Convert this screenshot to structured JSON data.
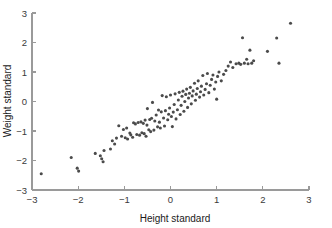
{
  "chart_data": {
    "type": "scatter",
    "title": "",
    "xlabel": "Height standard",
    "ylabel": "Weight standard",
    "xlim": [
      -3,
      3
    ],
    "ylim": [
      -3,
      3
    ],
    "xticks": [
      -3,
      -2,
      -1,
      0,
      1,
      2,
      3
    ],
    "yticks": [
      -3,
      -2,
      -1,
      0,
      1,
      2,
      3
    ],
    "xtick_labels": [
      "−3",
      "−2",
      "−1",
      "0",
      "1",
      "2",
      "3"
    ],
    "ytick_labels": [
      "−3",
      "−2",
      "−1",
      "0",
      "1",
      "2",
      "3"
    ],
    "grid": false,
    "legend": false,
    "marker_color": "#4b4b4b",
    "marker_size": 3.1,
    "axis_color": "#9a9a9a",
    "background_color": "#ffffff",
    "series": [
      {
        "name": "observations",
        "points": [
          [
            -2.8,
            -2.45
          ],
          [
            -2.15,
            -1.9
          ],
          [
            -2.02,
            -2.26
          ],
          [
            -1.99,
            -2.36
          ],
          [
            -1.63,
            -1.76
          ],
          [
            -1.52,
            -1.84
          ],
          [
            -1.49,
            -1.94
          ],
          [
            -1.46,
            -2.04
          ],
          [
            -1.44,
            -1.66
          ],
          [
            -1.3,
            -1.61
          ],
          [
            -1.26,
            -1.33
          ],
          [
            -1.21,
            -1.44
          ],
          [
            -1.17,
            -1.24
          ],
          [
            -1.12,
            -0.82
          ],
          [
            -1.06,
            -1.18
          ],
          [
            -1.02,
            -0.95
          ],
          [
            -0.98,
            -1.23
          ],
          [
            -0.95,
            -0.9
          ],
          [
            -0.93,
            -1.27
          ],
          [
            -0.88,
            -1.07
          ],
          [
            -0.86,
            -1.13
          ],
          [
            -0.82,
            -1.21
          ],
          [
            -0.8,
            -0.72
          ],
          [
            -0.76,
            -0.76
          ],
          [
            -0.73,
            -1.12
          ],
          [
            -0.7,
            -0.71
          ],
          [
            -0.67,
            -1.14
          ],
          [
            -0.64,
            -0.69
          ],
          [
            -0.62,
            -1.06
          ],
          [
            -0.59,
            -0.74
          ],
          [
            -0.57,
            -1.09
          ],
          [
            -0.55,
            -0.63
          ],
          [
            -0.53,
            -1.18
          ],
          [
            -0.51,
            -0.8
          ],
          [
            -0.5,
            -0.24
          ],
          [
            -0.47,
            -0.96
          ],
          [
            -0.45,
            -0.61
          ],
          [
            -0.43,
            -1.02
          ],
          [
            -0.41,
            -0.57
          ],
          [
            -0.39,
            -0.03
          ],
          [
            -0.36,
            -0.97
          ],
          [
            -0.34,
            -0.66
          ],
          [
            -0.31,
            -0.46
          ],
          [
            -0.28,
            -0.86
          ],
          [
            -0.26,
            -0.29
          ],
          [
            -0.24,
            -0.7
          ],
          [
            -0.22,
            -0.9
          ],
          [
            -0.2,
            -0.35
          ],
          [
            -0.18,
            0.2
          ],
          [
            -0.15,
            -0.56
          ],
          [
            -0.13,
            -0.83
          ],
          [
            -0.11,
            -0.31
          ],
          [
            -0.09,
            0.16
          ],
          [
            -0.06,
            -0.62
          ],
          [
            -0.04,
            -0.43
          ],
          [
            -0.02,
            -0.22
          ],
          [
            0.0,
            0.22
          ],
          [
            0.02,
            -0.51
          ],
          [
            0.04,
            -0.85
          ],
          [
            0.06,
            -0.36
          ],
          [
            0.08,
            -0.1
          ],
          [
            0.1,
            0.26
          ],
          [
            0.12,
            -0.59
          ],
          [
            0.15,
            -0.28
          ],
          [
            0.17,
            0.05
          ],
          [
            0.19,
            0.31
          ],
          [
            0.21,
            -0.44
          ],
          [
            0.23,
            -0.13
          ],
          [
            0.25,
            0.18
          ],
          [
            0.27,
            0.35
          ],
          [
            0.29,
            -0.33
          ],
          [
            0.31,
            0.0
          ],
          [
            0.33,
            0.24
          ],
          [
            0.35,
            0.42
          ],
          [
            0.37,
            -0.2
          ],
          [
            0.39,
            0.12
          ],
          [
            0.41,
            0.28
          ],
          [
            0.43,
            0.48
          ],
          [
            0.45,
            -0.08
          ],
          [
            0.47,
            0.19
          ],
          [
            0.49,
            0.36
          ],
          [
            0.52,
            0.62
          ],
          [
            0.54,
            0.04
          ],
          [
            0.56,
            0.25
          ],
          [
            0.58,
            0.44
          ],
          [
            0.6,
            0.7
          ],
          [
            0.63,
            0.15
          ],
          [
            0.65,
            0.33
          ],
          [
            0.67,
            0.52
          ],
          [
            0.7,
            0.88
          ],
          [
            0.72,
            0.22
          ],
          [
            0.75,
            0.41
          ],
          [
            0.78,
            0.6
          ],
          [
            0.8,
            0.95
          ],
          [
            0.83,
            0.3
          ],
          [
            0.86,
            0.55
          ],
          [
            0.89,
            0.75
          ],
          [
            0.92,
            0.9
          ],
          [
            0.95,
            0.42
          ],
          [
            0.98,
            0.66
          ],
          [
            1.0,
            0.08
          ],
          [
            1.02,
            0.85
          ],
          [
            1.05,
            1.0
          ],
          [
            1.1,
            0.7
          ],
          [
            1.15,
            0.92
          ],
          [
            1.2,
            1.05
          ],
          [
            1.25,
            1.2
          ],
          [
            1.3,
            1.34
          ],
          [
            1.35,
            1.15
          ],
          [
            1.42,
            1.28
          ],
          [
            1.48,
            1.3
          ],
          [
            1.52,
            1.26
          ],
          [
            1.56,
            2.16
          ],
          [
            1.6,
            1.3
          ],
          [
            1.65,
            1.43
          ],
          [
            1.68,
            1.28
          ],
          [
            1.72,
            1.74
          ],
          [
            1.76,
            1.3
          ],
          [
            1.8,
            1.38
          ],
          [
            2.1,
            1.7
          ],
          [
            2.3,
            2.15
          ],
          [
            2.35,
            1.3
          ],
          [
            2.6,
            2.65
          ]
        ]
      }
    ]
  },
  "figure": {
    "plot_area": {
      "x_min_px": 32,
      "x_max_px": 309,
      "y_min_px": 190,
      "y_max_px": 13
    }
  }
}
